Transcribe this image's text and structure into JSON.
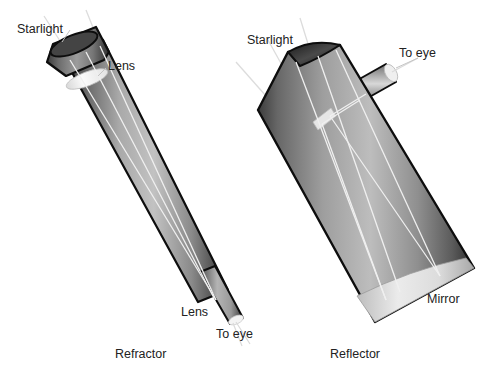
{
  "figure": {
    "type": "diagram",
    "background_color": "#ffffff",
    "text_color": "#222222"
  },
  "refractor": {
    "caption": "Refractor",
    "labels": {
      "starlight": "Starlight",
      "objective_lens": "Lens",
      "eyepiece_lens": "Lens",
      "to_eye": "To eye"
    },
    "tube_colors": {
      "rim_dark": "#111111",
      "body_dark": "#3b3b3b",
      "body_mid": "#8c8c8c",
      "body_light": "#c9c9c9",
      "lens_glass": "#f2f2f2"
    }
  },
  "reflector": {
    "caption": "Reflector",
    "labels": {
      "starlight": "Starlight",
      "to_eye": "To eye",
      "mirror": "Mirror"
    },
    "tube_colors": {
      "rim_dark": "#111111",
      "body_dark": "#4a4a4a",
      "body_mid": "#909090",
      "body_light": "#cfcfcf",
      "mirror_surface": "#e8e8e8"
    }
  },
  "rays": {
    "color": "#f4f4f4",
    "description": "Starlight rays enter the open tube, converge, and exit toward the eye"
  }
}
